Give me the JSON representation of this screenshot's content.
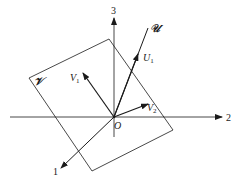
{
  "diagram": {
    "axes": {
      "axis_1": {
        "label": "1"
      },
      "axis_2": {
        "label": "2"
      },
      "axis_3": {
        "label": "3"
      }
    },
    "origin": {
      "label": "O"
    },
    "plane": {
      "label": "𝒱"
    },
    "subspace_line": {
      "label": "𝒰"
    },
    "vectors": {
      "U1": {
        "base": "U",
        "sub": "1"
      },
      "V1": {
        "base": "V",
        "sub": "1"
      },
      "V2": {
        "base": "V",
        "sub": "2"
      }
    },
    "colors": {
      "ink": "#1a1a1a",
      "background": "#ffffff"
    }
  }
}
